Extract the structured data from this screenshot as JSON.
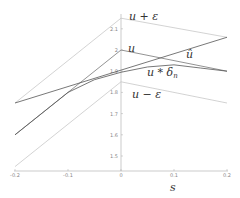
{
  "chart_data": {
    "type": "line",
    "title": "",
    "xlabel": "s",
    "ylabel": "",
    "xlim": [
      -0.2,
      0.2
    ],
    "ylim": [
      1.43,
      2.16
    ],
    "grid": false,
    "x_ticks": [
      "-0.2",
      "-0.1",
      "0",
      "0.1",
      "0.2"
    ],
    "y_ticks": [
      "1.5",
      "1.6",
      "1.7",
      "1.8",
      "1.9",
      "2",
      "2.1"
    ],
    "series": [
      {
        "name": "u + ε",
        "x": [
          -0.2,
          0,
          0.2
        ],
        "y": [
          1.75,
          2.15,
          2.06
        ],
        "color": "#c8c8c8"
      },
      {
        "name": "u",
        "x": [
          -0.2,
          0,
          0.2
        ],
        "y": [
          1.6,
          2.0,
          1.9
        ],
        "color": "#777777"
      },
      {
        "name": "û",
        "x": [
          -0.2,
          0.2
        ],
        "y": [
          1.75,
          2.06
        ],
        "color": "#555555"
      },
      {
        "name": "u * δn",
        "x": [
          -0.2,
          -0.1,
          -0.05,
          0,
          0.05,
          0.1,
          0.15,
          0.2
        ],
        "y": [
          1.6,
          1.8,
          1.86,
          1.895,
          1.92,
          1.93,
          1.915,
          1.9
        ],
        "color": "#555555"
      },
      {
        "name": "u − ε",
        "x": [
          -0.2,
          0,
          0.2
        ],
        "y": [
          1.45,
          1.85,
          1.75
        ],
        "color": "#c8c8c8"
      }
    ],
    "annotations": [
      {
        "text": "u + ε",
        "x": 0.01,
        "y": 2.15
      },
      {
        "text": "u",
        "x": 0.01,
        "y": 2.0
      },
      {
        "text": "û",
        "x": 0.12,
        "y": 1.96
      },
      {
        "text": "u * δn",
        "x": 0.05,
        "y": 1.87
      },
      {
        "text": "u − ε",
        "x": 0.02,
        "y": 1.8
      }
    ]
  },
  "labels": {
    "x_axis": "s",
    "u_plus_eps": "u + ε",
    "u": "u",
    "u_hat": "û",
    "u_conv": "u * δ",
    "u_conv_sub": "n",
    "u_minus_eps": "u − ε"
  }
}
